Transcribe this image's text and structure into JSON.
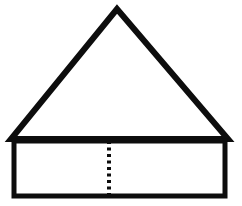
{
  "figure": {
    "background_color": "#ffffff",
    "stroke_color": "#0d0d0d",
    "canvas": {
      "width": 242,
      "height": 206
    },
    "shapes": {
      "triangle": {
        "name": "roof-triangle",
        "kind": "isosceles-triangle",
        "stroke_width": 6,
        "fill": "none",
        "points": "117,9 228,139 11,139",
        "apex": {
          "x": 117,
          "y": 9
        },
        "base_left": {
          "x": 11,
          "y": 139
        },
        "base_right": {
          "x": 228,
          "y": 139
        }
      },
      "rectangle": {
        "name": "base-rectangle",
        "kind": "rectangle",
        "stroke_width": 5,
        "fill": "none",
        "x": 14,
        "y": 141,
        "width": 211,
        "height": 55
      },
      "dotted_line": {
        "name": "vertical-dotted-bisector",
        "kind": "dotted-line",
        "stroke_width": 4,
        "dash_pattern": "3 3.5",
        "x": 109,
        "y_start": 141,
        "y_end": 196,
        "dot_count": 9
      }
    }
  }
}
